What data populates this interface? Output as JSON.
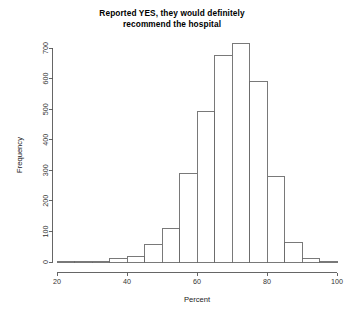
{
  "chart_data": {
    "type": "bar",
    "title": "Reported YES, they would definitely recommend the hospital",
    "title_line1": "Reported YES, they would definitely",
    "title_line2": "recommend the hospital",
    "xlabel": "Percent",
    "ylabel": "Frequency",
    "xlim": [
      20,
      100
    ],
    "ylim": [
      0,
      730
    ],
    "grid": false,
    "legend": null,
    "bin_width": 5,
    "bin_edges": [
      20,
      25,
      30,
      35,
      40,
      45,
      50,
      55,
      60,
      65,
      70,
      75,
      80,
      85,
      90,
      95,
      100
    ],
    "categories": [
      "20-25",
      "25-30",
      "30-35",
      "35-40",
      "40-45",
      "45-50",
      "50-55",
      "55-60",
      "60-65",
      "65-70",
      "70-75",
      "75-80",
      "80-85",
      "85-90",
      "90-95",
      "95-100"
    ],
    "values": [
      1,
      2,
      3,
      12,
      18,
      57,
      110,
      290,
      492,
      675,
      715,
      592,
      281,
      65,
      11,
      3
    ],
    "xticks": [
      20,
      40,
      60,
      80,
      100
    ],
    "xtick_labels": [
      "20",
      "40",
      "60",
      "80",
      "100"
    ],
    "yticks": [
      0,
      100,
      200,
      300,
      400,
      500,
      600,
      700
    ],
    "ytick_labels": [
      "0",
      "100",
      "200",
      "300",
      "400",
      "500",
      "600",
      "700"
    ],
    "colors": {
      "bar_fill": "#ffffff",
      "bar_stroke": "#6a6a6a",
      "axis": "#555555",
      "text": "#1a1a1a",
      "background": "#ffffff"
    }
  }
}
